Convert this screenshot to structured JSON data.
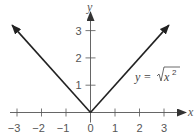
{
  "chart_data": {
    "type": "line",
    "title": "",
    "xlabel": "x",
    "ylabel": "y",
    "xlim": [
      -3.2,
      3.5
    ],
    "ylim": [
      0,
      3.5
    ],
    "x_ticks": [
      -3,
      -2,
      -1,
      0,
      1,
      2,
      3
    ],
    "x_tick_labels": [
      "−3",
      "−2",
      "−1",
      "0",
      "1",
      "2",
      "3"
    ],
    "y_ticks": [
      1,
      2,
      3
    ],
    "y_tick_labels": [
      "1",
      "2",
      "3"
    ],
    "grid": false,
    "series": [
      {
        "name": "y = sqrt(x^2)",
        "x": [
          -3.2,
          0,
          3.2
        ],
        "y": [
          3.2,
          0,
          3.2
        ],
        "arrows_at_ends": true
      }
    ],
    "annotations": [
      {
        "text_prefix": "y = ",
        "radical_content": "x",
        "exponent": "2",
        "x": 1.8,
        "y": 1.3
      }
    ],
    "colors": {
      "line": "#222222",
      "axis": "#555555"
    }
  }
}
